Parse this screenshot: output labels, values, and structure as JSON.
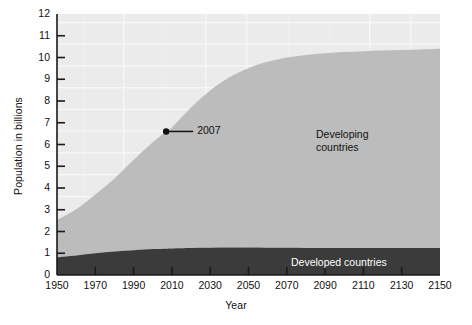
{
  "chart_data": {
    "type": "area",
    "title": "",
    "xlabel": "Year",
    "ylabel": "Population in billions",
    "xlim": [
      1950,
      2150
    ],
    "ylim": [
      0,
      12
    ],
    "grid": true,
    "stacked": true,
    "legend_position": "inline-annotation",
    "xticks": [
      1950,
      1970,
      1990,
      2010,
      2030,
      2050,
      2070,
      2090,
      2110,
      2130,
      2150
    ],
    "xtick_labels": [
      "1950",
      "1970",
      "1990",
      "2010",
      "2030",
      "2050",
      "2070",
      "2090",
      "2110",
      "2130",
      "2150"
    ],
    "yticks": [
      0,
      1,
      2,
      3,
      4,
      5,
      6,
      7,
      8,
      9,
      10,
      11,
      12
    ],
    "ytick_labels": [
      "0",
      "1",
      "2",
      "3",
      "4",
      "5",
      "6",
      "7",
      "8",
      "9",
      "10",
      "11",
      "12"
    ],
    "x": [
      1950,
      1960,
      1970,
      1980,
      1990,
      2000,
      2007,
      2010,
      2020,
      2030,
      2040,
      2050,
      2060,
      2070,
      2080,
      2090,
      2100,
      2110,
      2120,
      2130,
      2140,
      2150
    ],
    "series": [
      {
        "name": "Developed countries",
        "color": "#3b3b3b",
        "values": [
          0.81,
          0.9,
          1.0,
          1.08,
          1.14,
          1.19,
          1.21,
          1.22,
          1.24,
          1.25,
          1.26,
          1.26,
          1.25,
          1.25,
          1.24,
          1.24,
          1.24,
          1.24,
          1.24,
          1.24,
          1.24,
          1.24
        ]
      },
      {
        "name": "Developing countries",
        "color": "#bcbcbc",
        "values": [
          1.72,
          2.12,
          2.7,
          3.36,
          4.15,
          4.91,
          5.39,
          5.56,
          6.46,
          7.23,
          7.83,
          8.25,
          8.55,
          8.75,
          8.88,
          8.96,
          9.01,
          9.05,
          9.08,
          9.11,
          9.13,
          9.16
        ]
      }
    ],
    "totals": [
      2.53,
      3.02,
      3.7,
      4.44,
      5.29,
      6.1,
      6.6,
      6.78,
      7.7,
      8.48,
      9.09,
      9.51,
      9.8,
      10.0,
      10.12,
      10.2,
      10.25,
      10.29,
      10.32,
      10.35,
      10.37,
      10.4
    ],
    "annotations": [
      {
        "label": "2007",
        "x": 2007,
        "y": 6.6,
        "marker": "dot",
        "leader_line": true
      }
    ],
    "series_labels": [
      {
        "name": "developing",
        "line1": "Developing",
        "line2": "countries"
      },
      {
        "name": "developed",
        "line1": "Developed countries",
        "line2": ""
      }
    ],
    "colors": {
      "developed": "#3b3b3b",
      "developing": "#bcbcbc",
      "plot_background": "#ededed",
      "grid": "#f8f8f8",
      "axis": "#1a1a1a",
      "page_background": "#ffffff"
    }
  }
}
